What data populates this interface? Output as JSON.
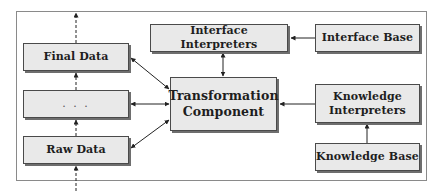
{
  "diagram": {
    "left_column": {
      "final_data": "Final Data",
      "ellipsis": ". . .",
      "raw_data": "Raw Data"
    },
    "center": {
      "interface_interpreters": "Interface Interpreters",
      "transformation_component_line1": "Transformation",
      "transformation_component_line2": "Component"
    },
    "right_column": {
      "interface_base": "Interface Base",
      "knowledge_interpreters_line1": "Knowledge",
      "knowledge_interpreters_line2": "Interpreters",
      "knowledge_base": "Knowledge Base"
    },
    "connections": [
      {
        "from": "Interface Base",
        "to": "Interface Interpreters",
        "type": "single-arrow"
      },
      {
        "from": "Interface Interpreters",
        "to": "Transformation Component",
        "type": "double-arrow"
      },
      {
        "from": "Knowledge Base",
        "to": "Knowledge Interpreters",
        "type": "single-arrow"
      },
      {
        "from": "Knowledge Interpreters",
        "to": "Transformation Component",
        "type": "single-arrow"
      },
      {
        "from": "Transformation Component",
        "to": "Final Data",
        "type": "double-arrow"
      },
      {
        "from": "Transformation Component",
        "to": ". . .",
        "type": "double-arrow"
      },
      {
        "from": "Transformation Component",
        "to": "Raw Data",
        "type": "double-arrow"
      },
      {
        "from": "Raw Data",
        "to": ". . .",
        "type": "dashed-arrow"
      },
      {
        "from": ". . .",
        "to": "Final Data",
        "type": "dashed-arrow"
      }
    ],
    "colors": {
      "box_fill": "#e9e9e9",
      "box_border": "#4a4a4a",
      "box_shadow": "#6e6e6e",
      "frame": "#8a8a8a",
      "arrow": "#222222"
    }
  }
}
